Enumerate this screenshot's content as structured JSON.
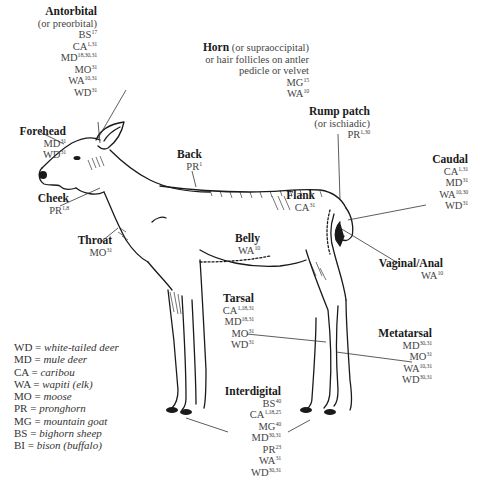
{
  "glands": [
    {
      "id": "antorbital",
      "name": "Antorbital",
      "subtitle": "(or preorbital)",
      "entries": [
        {
          "code": "BS",
          "refs": "17"
        },
        {
          "code": "CA",
          "refs": "1,31"
        },
        {
          "code": "MD",
          "refs": "18,30,31"
        },
        {
          "code": "MO",
          "refs": "31"
        },
        {
          "code": "WA",
          "refs": "10,31"
        },
        {
          "code": "WD",
          "refs": "31"
        }
      ]
    },
    {
      "id": "horn",
      "name": "Horn",
      "name_suffix": " (or supraoccipital)",
      "subtitle": "or hair follicles on antler",
      "subtitle2": "pedicle or velvet",
      "entries": [
        {
          "code": "MG",
          "refs": "15"
        },
        {
          "code": "WA",
          "refs": "10"
        }
      ]
    },
    {
      "id": "forehead",
      "name": "Forehead",
      "entries": [
        {
          "code": "MD",
          "refs": "31"
        },
        {
          "code": "WD",
          "refs": "31"
        }
      ]
    },
    {
      "id": "cheek",
      "name": "Cheek",
      "entries": [
        {
          "code": "PR",
          "refs": "1,8"
        }
      ]
    },
    {
      "id": "throat",
      "name": "Throat",
      "entries": [
        {
          "code": "MO",
          "refs": "31"
        }
      ]
    },
    {
      "id": "back",
      "name": "Back",
      "entries": [
        {
          "code": "PR",
          "refs": "1"
        }
      ]
    },
    {
      "id": "rump",
      "name": "Rump patch",
      "subtitle": "(or ischiadic)",
      "entries": [
        {
          "code": "PR",
          "refs": "1,30"
        }
      ]
    },
    {
      "id": "caudal",
      "name": "Caudal",
      "entries": [
        {
          "code": "CA",
          "refs": "1,31"
        },
        {
          "code": "MD",
          "refs": "31"
        },
        {
          "code": "WA",
          "refs": "10,30"
        },
        {
          "code": "WD",
          "refs": "31"
        }
      ]
    },
    {
      "id": "flank",
      "name": "Flank",
      "entries": [
        {
          "code": "CA",
          "refs": "31"
        }
      ]
    },
    {
      "id": "belly",
      "name": "Belly",
      "entries": [
        {
          "code": "WA",
          "refs": "10"
        }
      ]
    },
    {
      "id": "vaginal",
      "name": "Vaginal/Anal",
      "entries": [
        {
          "code": "WA",
          "refs": "10"
        }
      ]
    },
    {
      "id": "tarsal",
      "name": "Tarsal",
      "entries": [
        {
          "code": "CA",
          "refs": "1,18,31"
        },
        {
          "code": "MD",
          "refs": "18,31"
        },
        {
          "code": "MO",
          "refs": "31"
        },
        {
          "code": "WD",
          "refs": "31"
        }
      ]
    },
    {
      "id": "metatarsal",
      "name": "Metatarsal",
      "entries": [
        {
          "code": "MD",
          "refs": "30,31"
        },
        {
          "code": "MO",
          "refs": "31"
        },
        {
          "code": "WA",
          "refs": "10,31"
        },
        {
          "code": "WD",
          "refs": "30,31"
        }
      ]
    },
    {
      "id": "interdigital",
      "name": "Interdigital",
      "entries": [
        {
          "code": "BS",
          "refs": "40"
        },
        {
          "code": "CA",
          "refs": "1,18,25"
        },
        {
          "code": "MG",
          "refs": "40"
        },
        {
          "code": "MD",
          "refs": "30,31"
        },
        {
          "code": "PR",
          "refs": "23"
        },
        {
          "code": "WA",
          "refs": "31"
        },
        {
          "code": "WD",
          "refs": "30,31"
        }
      ]
    }
  ],
  "legend": [
    {
      "code": "WD",
      "meaning": "white-tailed deer"
    },
    {
      "code": "MD",
      "meaning": "mule deer"
    },
    {
      "code": "CA",
      "meaning": "caribou"
    },
    {
      "code": "WA",
      "meaning": "wapiti (elk)"
    },
    {
      "code": "MO",
      "meaning": "moose"
    },
    {
      "code": "PR",
      "meaning": "pronghorn"
    },
    {
      "code": "MG",
      "meaning": "mountain goat"
    },
    {
      "code": "BS",
      "meaning": "bighorn sheep"
    },
    {
      "code": "BI",
      "meaning": "bison (buffalo)"
    }
  ],
  "colors": {
    "ink": "#1a1a1a",
    "text": "#444444",
    "background": "#ffffff"
  }
}
